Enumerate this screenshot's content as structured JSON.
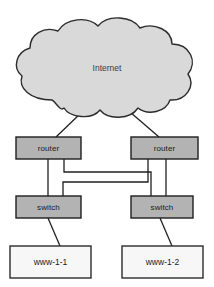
{
  "diagram": {
    "colors": {
      "background": "#ffffff",
      "cloud_fill": "#d9d9d9",
      "cloud_stroke": "#2b2b2b",
      "device_fill": "#b3b3b3",
      "device_stroke": "#1f1f1f",
      "server_fill": "#f7f7f7",
      "server_stroke": "#2b2b2b",
      "link_stroke": "#1f1f1f",
      "label_text": "#1b1b1b"
    },
    "cloud": {
      "name": "internet-cloud",
      "label": "Internet"
    },
    "routers": [
      {
        "id": "router-left",
        "label": "router"
      },
      {
        "id": "router-right",
        "label": "router"
      }
    ],
    "switches": [
      {
        "id": "switch-left",
        "label": "switch"
      },
      {
        "id": "switch-right",
        "label": "switch"
      }
    ],
    "servers": [
      {
        "id": "server-left",
        "label": "www-1-1"
      },
      {
        "id": "server-right",
        "label": "www-1-2"
      }
    ],
    "links": [
      {
        "from": "internet-cloud",
        "to": "router-left",
        "style": "diagonal"
      },
      {
        "from": "internet-cloud",
        "to": "router-right",
        "style": "diagonal"
      },
      {
        "from": "router-left",
        "to": "switch-left",
        "style": "straight"
      },
      {
        "from": "router-left",
        "to": "switch-right",
        "style": "crossover"
      },
      {
        "from": "router-right",
        "to": "switch-right",
        "style": "straight"
      },
      {
        "from": "router-right",
        "to": "switch-left",
        "style": "crossover"
      },
      {
        "from": "switch-left",
        "to": "server-left",
        "style": "diagonal"
      },
      {
        "from": "switch-right",
        "to": "server-right",
        "style": "diagonal"
      }
    ]
  }
}
